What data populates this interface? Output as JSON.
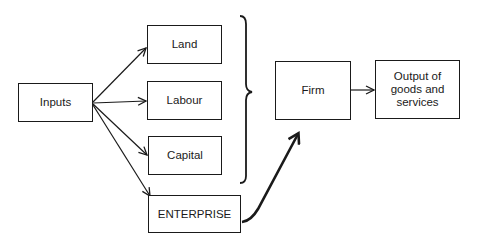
{
  "diagram": {
    "nodes": {
      "inputs": {
        "label": "Inputs"
      },
      "land": {
        "label": "Land"
      },
      "labour": {
        "label": "Labour"
      },
      "capital": {
        "label": "Capital"
      },
      "enterprise": {
        "label": "ENTERPRISE"
      },
      "firm": {
        "label": "Firm"
      },
      "output": {
        "label": "Output of goods and services"
      }
    },
    "edges": [
      {
        "from": "inputs",
        "to": "land"
      },
      {
        "from": "inputs",
        "to": "labour"
      },
      {
        "from": "inputs",
        "to": "capital"
      },
      {
        "from": "inputs",
        "to": "enterprise"
      },
      {
        "from": "land+labour+capital (brace)",
        "to": "firm",
        "style": "grouped"
      },
      {
        "from": "enterprise",
        "to": "firm",
        "style": "thick-curved"
      },
      {
        "from": "firm",
        "to": "output"
      }
    ],
    "colors": {
      "stroke": "#1a1a1a",
      "background": "#ffffff"
    }
  }
}
